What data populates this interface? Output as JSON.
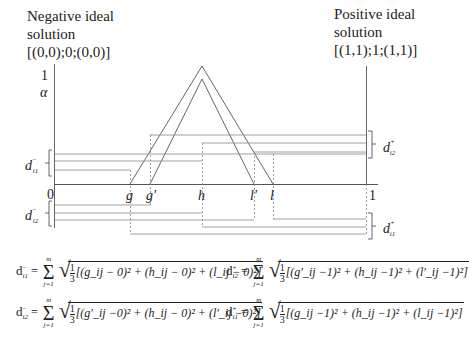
{
  "left_title": {
    "line1": "Negative ideal",
    "line2": "solution",
    "line3": "[(0,0);0;(0,0)]"
  },
  "right_title": {
    "line1": "Positive ideal",
    "line2": "solution",
    "line3": "[(1,1);1;(1,1)]"
  },
  "axis": {
    "y_top": "1",
    "y_alpha": "α",
    "x_origin": "0",
    "x_end": "1",
    "points": [
      "g",
      "g′",
      "h",
      "l′",
      "l"
    ]
  },
  "brackets": {
    "d_i1_minus": {
      "base": "d",
      "sub": "i1",
      "sup": "−"
    },
    "d_i2_minus": {
      "base": "d",
      "sub": "i2",
      "sup": "−"
    },
    "d_i2_plus": {
      "base": "d",
      "sub": "i2",
      "sup": "+"
    },
    "d_i1_plus": {
      "base": "d",
      "sub": "i1",
      "sup": "+"
    }
  },
  "formulas": {
    "f1": {
      "lhs_base": "d",
      "lhs_sub": "i1",
      "lhs_sup": "−",
      "sum_top": "m",
      "sum_bottom": "j=1",
      "frac_num": "1",
      "frac_den": "3",
      "body": "[(g_ij − 0)² + (h_ij − 0)² + (l_ij − 0)²]"
    },
    "f2": {
      "lhs_base": "d",
      "lhs_sub": "i2",
      "lhs_sup": "+",
      "sum_top": "m",
      "sum_bottom": "j=1",
      "frac_num": "1",
      "frac_den": "3",
      "body": "[(g′_ij −1)² + (h_ij −1)² + (l′_ij −1)²]"
    },
    "f3": {
      "lhs_base": "d",
      "lhs_sub": "i2",
      "lhs_sup": "−",
      "sum_top": "m",
      "sum_bottom": "j=1",
      "frac_num": "1",
      "frac_den": "3",
      "body": "[(g′_ij −0)² + (h_ij − 0)² + (l′_ij −0)²]"
    },
    "f4": {
      "lhs_base": "d",
      "lhs_sub": "i1",
      "lhs_sup": "+",
      "sum_top": "m",
      "sum_bottom": "j=1",
      "frac_num": "1",
      "frac_den": "3",
      "body": "[(g_ij −1)² + (h_ij −1)² + (l_ij −1)²]"
    }
  },
  "colors": {
    "line": "#555555",
    "text": "#222222",
    "background": "#ffffff"
  }
}
